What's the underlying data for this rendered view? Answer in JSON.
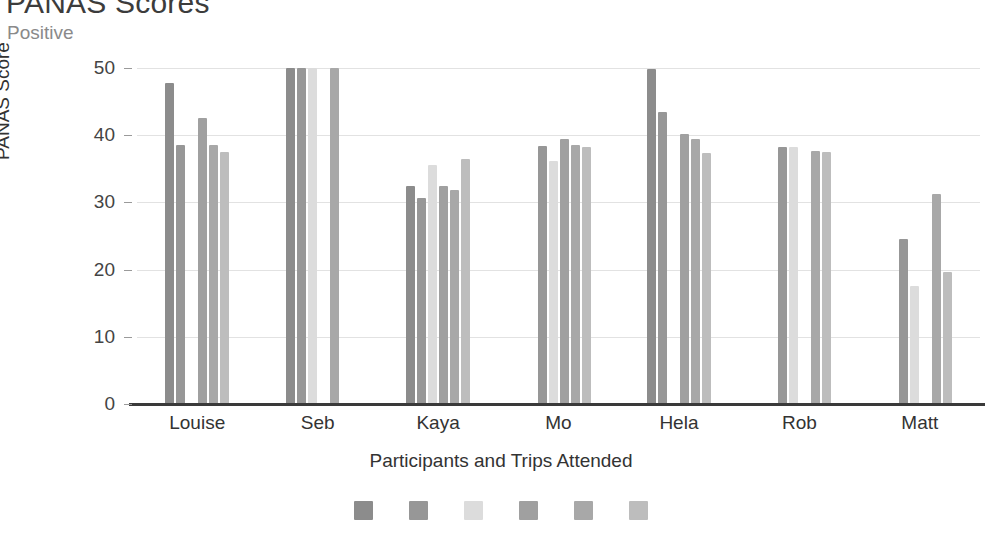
{
  "title": "PANAS Scores",
  "subtitle": "Positive",
  "chart_data": {
    "type": "bar",
    "title": "PANAS Scores",
    "subtitle": "Positive",
    "xlabel": "Participants and Trips Attended",
    "ylabel": "PANAS Score",
    "ylim": [
      0,
      50
    ],
    "yticks": [
      0,
      10,
      20,
      30,
      40,
      50
    ],
    "ytick_labels": [
      "0",
      "10",
      "20",
      "30",
      "40",
      "50"
    ],
    "grid": true,
    "legend_position": "bottom",
    "categories": [
      "Louise",
      "Seb",
      "Kaya",
      "Mo",
      "Hela",
      "Rob",
      "Matt"
    ],
    "series": [
      {
        "name": "Trip 1",
        "color": "#8c8c8c",
        "values": [
          47.8,
          50.0,
          32.5,
          null,
          49.8,
          null,
          null
        ]
      },
      {
        "name": "Trip 2",
        "color": "#979797",
        "values": [
          38.5,
          50.0,
          30.7,
          38.4,
          43.4,
          38.3,
          24.5
        ]
      },
      {
        "name": "Trip 3",
        "color": "#dcdcdc",
        "values": [
          null,
          50.0,
          35.6,
          36.2,
          null,
          38.3,
          17.6
        ]
      },
      {
        "name": "Trip 4",
        "color": "#a0a0a0",
        "values": [
          42.5,
          null,
          32.4,
          39.4,
          40.2,
          null,
          null
        ]
      },
      {
        "name": "Trip 5",
        "color": "#a8a8a8",
        "values": [
          38.5,
          50.0,
          31.8,
          38.6,
          39.4,
          37.7,
          31.3
        ]
      },
      {
        "name": "Trip 6",
        "color": "#bdbdbd",
        "values": [
          37.5,
          null,
          36.4,
          38.3,
          37.4,
          37.5,
          19.6
        ]
      }
    ]
  }
}
